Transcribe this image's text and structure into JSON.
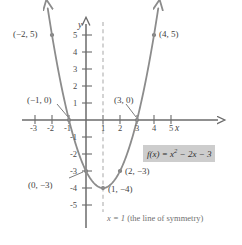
{
  "figure": {
    "type": "math-graph"
  },
  "axes": {
    "x_label": "x",
    "y_label": "y",
    "x_ticks": [
      "-3",
      "-2",
      "-1",
      "1",
      "2",
      "3",
      "4",
      "5"
    ],
    "y_ticks": [
      "5",
      "4",
      "3",
      "2",
      "1",
      "-1",
      "-2",
      "-3",
      "-4",
      "-5"
    ],
    "x_range": [
      -3.6,
      5.8
    ],
    "y_range": [
      -5.6,
      5.9
    ],
    "origin_px": [
      86,
      120
    ],
    "unit_px": 17
  },
  "equation": {
    "lhs": "f(x) = x",
    "exponent": "2",
    "rhs": " − 2x − 3",
    "full": "f(x) = x² − 2x − 3"
  },
  "symmetry": {
    "equation": "x = 1",
    "caption": "(the line of symmetry)",
    "x_value": 1
  },
  "points": [
    {
      "label": "(−2, 5)",
      "x": -2,
      "y": 5
    },
    {
      "label": "(4, 5)",
      "x": 4,
      "y": 5
    },
    {
      "label": "(−1, 0)",
      "x": -1,
      "y": 0
    },
    {
      "label": "(3, 0)",
      "x": 3,
      "y": 0
    },
    {
      "label": "(0, −3)",
      "x": 0,
      "y": -3
    },
    {
      "label": "(2, −3)",
      "x": 2,
      "y": -3
    },
    {
      "label": "(1, −4)",
      "x": 1,
      "y": -4
    }
  ],
  "chart_data": {
    "type": "line",
    "title": "",
    "xlabel": "x",
    "ylabel": "y",
    "function": "f(x) = x^2 - 2x - 3",
    "vertex": [
      1,
      -4
    ],
    "roots": [
      -1,
      3
    ],
    "y_intercept": -3,
    "axis_of_symmetry": 1,
    "x": [
      -2,
      -1.5,
      -1,
      -0.5,
      0,
      0.5,
      1,
      1.5,
      2,
      2.5,
      3,
      3.5,
      4
    ],
    "y": [
      5,
      2.25,
      0,
      -1.75,
      -3,
      -3.75,
      -4,
      -3.75,
      -3,
      -1.75,
      0,
      2.25,
      5
    ],
    "xlim": [
      -3.6,
      5.8
    ],
    "ylim": [
      -5.6,
      5.9
    ],
    "grid": false,
    "legend": false,
    "marked_points": [
      {
        "x": -2,
        "y": 5,
        "label": "(−2, 5)"
      },
      {
        "x": -1,
        "y": 0,
        "label": "(−1, 0)"
      },
      {
        "x": 0,
        "y": -3,
        "label": "(0, −3)"
      },
      {
        "x": 1,
        "y": -4,
        "label": "(1, −4)"
      },
      {
        "x": 2,
        "y": -3,
        "label": "(2, −3)"
      },
      {
        "x": 3,
        "y": 0,
        "label": "(3, 0)"
      },
      {
        "x": 4,
        "y": 5,
        "label": "(4, 5)"
      }
    ]
  },
  "colors": {
    "curve": "#8c8c8c",
    "axis": "#6b6b6b",
    "dashed": "#b0b0b0",
    "text": "#3a3a3a",
    "eq_background": "#cdcdcd"
  }
}
